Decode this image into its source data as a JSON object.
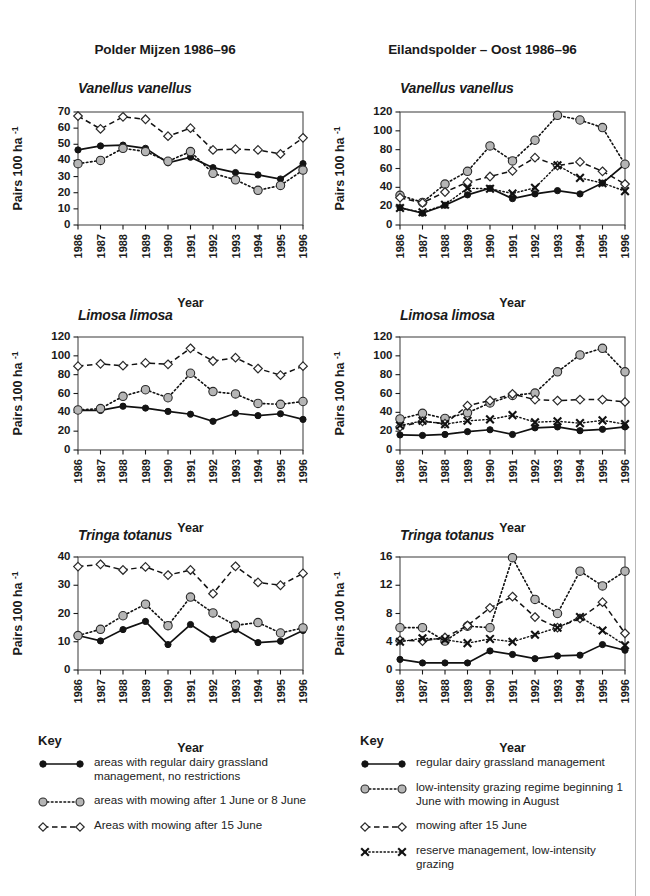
{
  "page": {
    "left_panel_title": "Polder Mijzen 1986–96",
    "right_panel_title": "Eilandspolder – Oost 1986–96"
  },
  "axes": {
    "xlabel": "Year",
    "ylabel_main": "Pairs 100 ha",
    "ylabel_sup": "-1",
    "years": [
      "1986",
      "1987",
      "1988",
      "1989",
      "1990",
      "1991",
      "1992",
      "1993",
      "1994",
      "1995",
      "1996"
    ]
  },
  "species": {
    "vanellus": "Vanellus vanellus",
    "limosa": "Limosa limosa",
    "tringa": "Tringa totanus"
  },
  "key_left": {
    "title": "Key",
    "items": [
      {
        "symbol": "filled-circle-solid-line",
        "label": "areas with regular dairy grassland management, no restrictions"
      },
      {
        "symbol": "grey-circle-dotted-line",
        "label": "areas with mowing after 1 June or 8 June"
      },
      {
        "symbol": "open-diamond-dashed-line",
        "label": "Areas with mowing after 15 June"
      }
    ]
  },
  "key_right": {
    "title": "Key",
    "items": [
      {
        "symbol": "filled-circle-solid-line",
        "label": "regular dairy grassland management"
      },
      {
        "symbol": "grey-circle-dotted-line",
        "label": "low-intensity grazing regime beginning 1 June with mowing in August"
      },
      {
        "symbol": "open-diamond-dashed-line",
        "label": "mowing after 15 June"
      },
      {
        "symbol": "x-marker-dotted-line",
        "label": "reserve management, low-intensity grazing"
      }
    ]
  },
  "chart_data": [
    {
      "id": "mijzen-vanellus",
      "type": "line",
      "title": "Vanellus vanellus",
      "panel": "Polder Mijzen 1986–96",
      "xlabel": "Year",
      "ylabel": "Pairs 100 ha-1",
      "x": [
        "1986",
        "1987",
        "1988",
        "1989",
        "1990",
        "1991",
        "1992",
        "1993",
        "1994",
        "1995",
        "1996"
      ],
      "ylim": [
        0,
        70
      ],
      "yticks": [
        0,
        10,
        20,
        30,
        40,
        50,
        60,
        70
      ],
      "grid": false,
      "legend": "below-figure",
      "series": [
        {
          "name": "areas with regular dairy grassland management, no restrictions",
          "marker": "filled-circle",
          "line": "solid",
          "values": [
            46.5,
            49.0,
            49.5,
            47.5,
            38.5,
            42.0,
            35.5,
            32.5,
            31.0,
            28.5,
            38.0
          ]
        },
        {
          "name": "areas with mowing after 1 June or 8 June",
          "marker": "grey-circle",
          "line": "dotted",
          "values": [
            38.0,
            40.0,
            47.5,
            45.5,
            39.5,
            45.5,
            32.0,
            28.0,
            21.5,
            24.5,
            34.0
          ]
        },
        {
          "name": "Areas with mowing after 15 June",
          "marker": "open-diamond",
          "line": "dashed",
          "values": [
            67.5,
            59.5,
            67.0,
            65.5,
            55.0,
            60.0,
            46.5,
            47.0,
            46.5,
            44.0,
            54.0
          ]
        }
      ]
    },
    {
      "id": "eilandspolder-vanellus",
      "type": "line",
      "title": "Vanellus vanellus",
      "panel": "Eilandspolder – Oost 1986–96",
      "xlabel": "Year",
      "ylabel": "Pairs 100 ha-1",
      "x": [
        "1986",
        "1987",
        "1988",
        "1989",
        "1990",
        "1991",
        "1992",
        "1993",
        "1994",
        "1995",
        "1996"
      ],
      "ylim": [
        0,
        120
      ],
      "yticks": [
        0,
        20,
        40,
        60,
        80,
        100,
        120
      ],
      "grid": false,
      "legend": "below-figure",
      "series": [
        {
          "name": "regular dairy grassland management",
          "marker": "filled-circle",
          "line": "solid",
          "values": [
            18.5,
            12.5,
            21.0,
            32.0,
            39.0,
            28.0,
            33.0,
            36.5,
            33.0,
            44.5,
            64.5
          ]
        },
        {
          "name": "low-intensity grazing regime beginning 1 June with mowing in August",
          "marker": "grey-circle",
          "line": "dotted",
          "values": [
            31.5,
            24.0,
            43.5,
            57.0,
            84.0,
            68.0,
            90.0,
            116.5,
            111.5,
            103.5,
            64.5
          ]
        },
        {
          "name": "mowing after 15 June",
          "marker": "open-diamond",
          "line": "dashed",
          "values": [
            29.0,
            23.5,
            35.0,
            45.5,
            51.5,
            57.5,
            71.5,
            63.0,
            67.0,
            57.0,
            43.5
          ]
        },
        {
          "name": "reserve management, low-intensity grazing",
          "marker": "x",
          "line": "dotted",
          "values": [
            18.0,
            13.5,
            21.5,
            39.0,
            38.5,
            33.5,
            39.5,
            63.5,
            50.0,
            44.5,
            36.0
          ]
        }
      ]
    },
    {
      "id": "mijzen-limosa",
      "type": "line",
      "title": "Limosa limosa",
      "panel": "Polder Mijzen 1986–96",
      "xlabel": "Year",
      "ylabel": "Pairs 100 ha-1",
      "x": [
        "1986",
        "1987",
        "1988",
        "1989",
        "1990",
        "1991",
        "1992",
        "1993",
        "1994",
        "1995",
        "1996"
      ],
      "ylim": [
        0,
        120
      ],
      "yticks": [
        0,
        20,
        40,
        60,
        80,
        100,
        120
      ],
      "grid": false,
      "legend": "below-figure",
      "series": [
        {
          "name": "areas with regular dairy grassland management, no restrictions",
          "marker": "filled-circle",
          "line": "solid",
          "values": [
            42.0,
            42.0,
            46.5,
            44.5,
            41.0,
            38.0,
            30.5,
            39.0,
            36.5,
            38.5,
            32.5
          ]
        },
        {
          "name": "areas with mowing after 1 June or 8 June",
          "marker": "grey-circle",
          "line": "dotted",
          "values": [
            42.5,
            44.0,
            57.0,
            64.0,
            55.5,
            81.5,
            62.0,
            59.5,
            49.5,
            48.5,
            51.5
          ]
        },
        {
          "name": "Areas with mowing after 15 June",
          "marker": "open-diamond",
          "line": "dashed",
          "values": [
            89.0,
            91.5,
            89.5,
            92.5,
            91.0,
            108.0,
            94.5,
            98.0,
            86.5,
            79.5,
            89.0
          ]
        }
      ]
    },
    {
      "id": "eilandspolder-limosa",
      "type": "line",
      "title": "Limosa limosa",
      "panel": "Eilandspolder – Oost 1986–96",
      "xlabel": "Year",
      "ylabel": "Pairs 100 ha-1",
      "x": [
        "1986",
        "1987",
        "1988",
        "1989",
        "1990",
        "1991",
        "1992",
        "1993",
        "1994",
        "1995",
        "1996"
      ],
      "ylim": [
        0,
        120
      ],
      "yticks": [
        0,
        20,
        40,
        60,
        80,
        100,
        120
      ],
      "grid": false,
      "legend": "below-figure",
      "series": [
        {
          "name": "regular dairy grassland management",
          "marker": "filled-circle",
          "line": "solid",
          "values": [
            16.0,
            15.5,
            16.5,
            19.5,
            21.5,
            16.5,
            23.5,
            24.5,
            20.5,
            22.0,
            24.5
          ]
        },
        {
          "name": "low-intensity grazing regime beginning 1 June with mowing in August",
          "marker": "grey-circle",
          "line": "dotted",
          "values": [
            33.0,
            39.0,
            33.5,
            39.5,
            50.0,
            58.0,
            60.5,
            83.0,
            101.0,
            108.0,
            83.0
          ]
        },
        {
          "name": "mowing after 15 June",
          "marker": "open-diamond",
          "line": "dashed",
          "values": [
            24.5,
            30.5,
            28.0,
            47.0,
            52.5,
            59.5,
            53.5,
            52.5,
            53.5,
            53.5,
            51.0
          ]
        },
        {
          "name": "reserve management, low-intensity grazing",
          "marker": "x",
          "line": "dotted",
          "values": [
            26.0,
            31.0,
            27.5,
            31.0,
            32.5,
            37.0,
            29.5,
            30.5,
            28.5,
            31.5,
            27.5
          ]
        }
      ]
    },
    {
      "id": "mijzen-tringa",
      "type": "line",
      "title": "Tringa totanus",
      "panel": "Polder Mijzen 1986–96",
      "xlabel": "Year",
      "ylabel": "Pairs 100 ha-1",
      "x": [
        "1986",
        "1987",
        "1988",
        "1989",
        "1990",
        "1991",
        "1992",
        "1993",
        "1994",
        "1995",
        "1996"
      ],
      "ylim": [
        0,
        40
      ],
      "yticks": [
        0,
        10,
        20,
        30,
        40
      ],
      "grid": false,
      "legend": "below-figure",
      "series": [
        {
          "name": "areas with regular dairy grassland management, no restrictions",
          "marker": "filled-circle",
          "line": "solid",
          "values": [
            12.2,
            10.3,
            14.3,
            17.2,
            9.0,
            16.1,
            10.9,
            14.3,
            9.7,
            10.2,
            14.0
          ]
        },
        {
          "name": "areas with mowing after 1 June or 8 June",
          "marker": "grey-circle",
          "line": "dotted",
          "values": [
            12.2,
            14.4,
            19.2,
            23.3,
            15.7,
            25.8,
            20.2,
            15.8,
            16.8,
            13.1,
            14.9
          ]
        },
        {
          "name": "Areas with mowing after 15 June",
          "marker": "open-diamond",
          "line": "dashed",
          "values": [
            36.6,
            37.4,
            35.4,
            36.5,
            33.6,
            35.4,
            27.0,
            36.7,
            31.0,
            30.0,
            34.2
          ]
        }
      ]
    },
    {
      "id": "eilandspolder-tringa",
      "type": "line",
      "title": "Tringa totanus",
      "panel": "Eilandspolder – Oost 1986–96",
      "xlabel": "Year",
      "ylabel": "Pairs 100 ha-1",
      "x": [
        "1986",
        "1987",
        "1988",
        "1989",
        "1990",
        "1991",
        "1992",
        "1993",
        "1994",
        "1995",
        "1996"
      ],
      "ylim": [
        0,
        16
      ],
      "yticks": [
        0,
        4,
        8,
        12,
        16
      ],
      "grid": false,
      "legend": "below-figure",
      "series": [
        {
          "name": "regular dairy grassland management",
          "marker": "filled-circle",
          "line": "solid",
          "values": [
            1.5,
            1.0,
            1.0,
            1.0,
            2.7,
            2.2,
            1.6,
            2.0,
            2.1,
            3.6,
            2.8
          ]
        },
        {
          "name": "low-intensity grazing regime beginning 1 June with mowing in August",
          "marker": "grey-circle",
          "line": "dotted",
          "values": [
            6.0,
            6.0,
            4.1,
            6.2,
            6.0,
            15.9,
            10.0,
            8.0,
            14.0,
            11.9,
            14.0
          ]
        },
        {
          "name": "mowing after 15 June",
          "marker": "open-diamond",
          "line": "dashed",
          "values": [
            4.2,
            4.1,
            4.6,
            6.3,
            8.8,
            10.4,
            7.5,
            6.0,
            7.3,
            9.6,
            5.2
          ]
        },
        {
          "name": "reserve management, low-intensity grazing",
          "marker": "x",
          "line": "dotted",
          "values": [
            4.0,
            4.5,
            4.3,
            3.8,
            4.4,
            4.0,
            5.0,
            6.0,
            7.5,
            5.6,
            3.5
          ]
        }
      ]
    }
  ]
}
